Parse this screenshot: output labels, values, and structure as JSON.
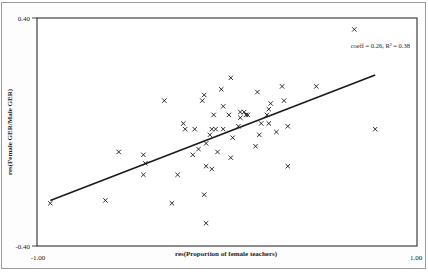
{
  "chart_data": {
    "type": "scatter",
    "title": "",
    "xlabel": "res(Proportion of female teachers)",
    "ylabel": "res(Female GER/Male GER)",
    "xlim": [
      -1.0,
      1.0
    ],
    "ylim": [
      -0.4,
      0.4
    ],
    "x_tick_labels": [
      "-1.00",
      "1.00"
    ],
    "y_tick_labels": [
      "0.40",
      "-0.40"
    ],
    "grid": false,
    "legend": null,
    "annotation": "coeff = 0.26, R² = 0.38",
    "marker": "x",
    "points": [
      [
        -0.93,
        -0.25
      ],
      [
        -0.64,
        -0.24
      ],
      [
        -0.57,
        -0.07
      ],
      [
        -0.44,
        -0.08
      ],
      [
        -0.43,
        -0.11
      ],
      [
        -0.44,
        -0.15
      ],
      [
        -0.33,
        0.11
      ],
      [
        -0.29,
        -0.25
      ],
      [
        -0.26,
        -0.15
      ],
      [
        -0.23,
        0.03
      ],
      [
        -0.22,
        0.01
      ],
      [
        -0.18,
        -0.08
      ],
      [
        -0.17,
        0.01
      ],
      [
        -0.15,
        -0.06
      ],
      [
        -0.13,
        0.11
      ],
      [
        -0.12,
        0.13
      ],
      [
        -0.12,
        -0.22
      ],
      [
        -0.11,
        -0.32
      ],
      [
        -0.11,
        -0.12
      ],
      [
        -0.11,
        -0.04
      ],
      [
        -0.09,
        -0.01
      ],
      [
        -0.08,
        0.01
      ],
      [
        -0.08,
        -0.13
      ],
      [
        -0.07,
        0.06
      ],
      [
        -0.06,
        0.01
      ],
      [
        -0.05,
        -0.07
      ],
      [
        -0.03,
        0.15
      ],
      [
        -0.02,
        0.09
      ],
      [
        -0.02,
        0.01
      ],
      [
        0.01,
        0.06
      ],
      [
        0.02,
        -0.09
      ],
      [
        0.02,
        0.19
      ],
      [
        0.03,
        -0.02
      ],
      [
        0.06,
        0.02
      ],
      [
        0.07,
        0.05
      ],
      [
        0.07,
        0.07
      ],
      [
        0.09,
        0.07
      ],
      [
        0.1,
        0.06
      ],
      [
        0.11,
        0.06
      ],
      [
        0.15,
        -0.05
      ],
      [
        0.17,
        -0.01
      ],
      [
        0.16,
        0.14
      ],
      [
        0.18,
        0.03
      ],
      [
        0.21,
        0.06
      ],
      [
        0.22,
        0.08
      ],
      [
        0.22,
        0.03
      ],
      [
        0.23,
        0.1
      ],
      [
        0.26,
        0.0
      ],
      [
        0.29,
        0.16
      ],
      [
        0.3,
        0.11
      ],
      [
        0.32,
        0.02
      ],
      [
        0.32,
        -0.12
      ],
      [
        0.47,
        0.16
      ],
      [
        0.67,
        0.36
      ],
      [
        0.78,
        0.01
      ]
    ],
    "regression_line": {
      "slope": 0.26,
      "r_squared": 0.38,
      "x_start": -0.93,
      "y_start": -0.24,
      "x_end": 0.78,
      "y_end": 0.2
    }
  },
  "colors": {
    "background": "#ffffff",
    "ink": "#1a1a1a",
    "frame": "#9a9a9a"
  }
}
